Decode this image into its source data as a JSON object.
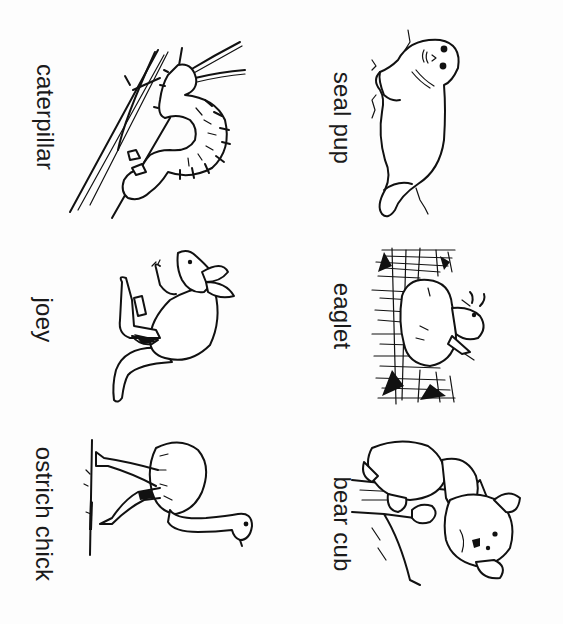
{
  "worksheet": {
    "layout": "2 columns x 3 rows, labels rotated 90 degrees clockwise",
    "ink_color": "#111111",
    "background_color": "#ffffff",
    "cards": [
      {
        "id": "caterpillar",
        "label": "caterpillar",
        "column": "left",
        "row": 1,
        "illustration": "caterpillar-on-branch"
      },
      {
        "id": "seal-pup",
        "label": "seal pup",
        "column": "right",
        "row": 1,
        "illustration": "seal-pup-lying"
      },
      {
        "id": "joey",
        "label": "joey",
        "column": "left",
        "row": 2,
        "illustration": "kangaroo-joey"
      },
      {
        "id": "eaglet",
        "label": "eaglet",
        "column": "right",
        "row": 2,
        "illustration": "eaglet-in-nest"
      },
      {
        "id": "ostrich-chick",
        "label": "ostrich chick",
        "column": "left",
        "row": 3,
        "illustration": "ostrich-chick-standing"
      },
      {
        "id": "bear-cub",
        "label": "bear cub",
        "column": "right",
        "row": 3,
        "illustration": "bear-cub-on-branch"
      }
    ]
  }
}
